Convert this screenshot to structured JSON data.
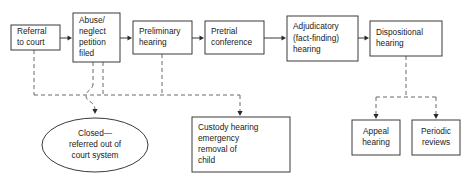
{
  "diagram": {
    "background_color": "#ffffff",
    "box_stroke_color": "#3a3a3a",
    "dashed_stroke_color": "#6b6b6b",
    "text_color": "#1a1a1a",
    "process_nodes": [
      {
        "id": "referral",
        "label_lines": [
          "Referral",
          "to court"
        ],
        "shape": "rect",
        "x": 11,
        "y": 25,
        "w": 49,
        "h": 25
      },
      {
        "id": "petition",
        "label_lines": [
          "Abuse/",
          "neglect",
          "petition",
          "filed"
        ],
        "shape": "rect",
        "x": 73,
        "y": 13,
        "w": 47,
        "h": 49
      },
      {
        "id": "preliminary",
        "label_lines": [
          "Preliminary",
          "hearing"
        ],
        "shape": "rect",
        "x": 133,
        "y": 21,
        "w": 59,
        "h": 33
      },
      {
        "id": "pretrial",
        "label_lines": [
          "Pretrial",
          "conference"
        ],
        "shape": "rect",
        "x": 205,
        "y": 21,
        "w": 59,
        "h": 33
      },
      {
        "id": "adjudicatory",
        "label_lines": [
          "Adjudicatory",
          "(fact-finding)",
          "hearing"
        ],
        "shape": "rect",
        "x": 287,
        "y": 16,
        "w": 71,
        "h": 45
      },
      {
        "id": "dispositional",
        "label_lines": [
          "Dispositional",
          "hearing"
        ],
        "shape": "rect",
        "x": 370,
        "y": 21,
        "w": 72,
        "h": 35
      },
      {
        "id": "closed",
        "label_lines": [
          "Closed—",
          "referred out of",
          "court system"
        ],
        "shape": "ellipse",
        "x": 42,
        "y": 118,
        "w": 106,
        "h": 54
      },
      {
        "id": "custody",
        "label_lines": [
          "Custody hearing",
          "emergency",
          "removal of",
          "child"
        ],
        "shape": "rect",
        "x": 192,
        "y": 117,
        "w": 98,
        "h": 55
      },
      {
        "id": "appeal",
        "label_lines": [
          "Appeal",
          "hearing"
        ],
        "shape": "rect",
        "x": 352,
        "y": 120,
        "w": 48,
        "h": 35
      },
      {
        "id": "periodic",
        "label_lines": [
          "Periodic",
          "reviews"
        ],
        "shape": "rect",
        "x": 412,
        "y": 120,
        "w": 48,
        "h": 35
      }
    ],
    "solid_connectors": [
      {
        "id": "referral-to-petition",
        "from": "referral",
        "to": "petition",
        "path": "M 60 38 L 70 38"
      },
      {
        "id": "petition-to-preliminary",
        "from": "petition",
        "to": "preliminary",
        "path": "M 120 38 L 130 38"
      },
      {
        "id": "preliminary-to-pretrial",
        "from": "preliminary",
        "to": "pretrial",
        "path": "M 192 38 L 202 38"
      },
      {
        "id": "pretrial-to-adjudicatory",
        "from": "pretrial",
        "to": "adjudicatory",
        "path": "M 264 38 L 284 38"
      },
      {
        "id": "adjudicatory-to-dispositional",
        "from": "adjudicatory",
        "to": "dispositional",
        "path": "M 358 38 L 367 38"
      }
    ],
    "solid_arrowheads": [
      {
        "id": "arrow-petition",
        "x": 72,
        "y": 38
      },
      {
        "id": "arrow-preliminary",
        "x": 132,
        "y": 38
      },
      {
        "id": "arrow-pretrial",
        "x": 204,
        "y": 38
      },
      {
        "id": "arrow-adjudicatory",
        "x": 286,
        "y": 38
      },
      {
        "id": "arrow-dispositional",
        "x": 369,
        "y": 38
      }
    ],
    "dashed_connectors": [
      {
        "id": "referral-drop",
        "path": "M 34 50 L 34 95"
      },
      {
        "id": "petition-drop-left",
        "path": "M 93 62 L 93 84"
      },
      {
        "id": "petition-drop-right",
        "path": "M 103 62 L 103 95"
      },
      {
        "id": "trunk-main",
        "path": "M 34 95 L 240 95"
      },
      {
        "id": "petition-jog-to-ellipse",
        "path": "M 93 84 C 93 90, 86 90, 86 96 C 86 102, 95 101, 95 110"
      },
      {
        "id": "preliminary-drop",
        "path": "M 162 54 L 162 95"
      },
      {
        "id": "trunk-to-custody",
        "path": "M 240 95 L 240 112"
      },
      {
        "id": "dispositional-drop",
        "path": "M 406 56 L 406 97"
      },
      {
        "id": "dispositional-branch",
        "path": "M 376 97 L 436 97"
      },
      {
        "id": "branch-to-appeal",
        "path": "M 376 97 L 376 115"
      },
      {
        "id": "branch-to-periodic",
        "path": "M 436 97 L 436 115"
      }
    ],
    "dashed_arrowheads": [
      {
        "id": "arrow-to-closed",
        "x": 95,
        "y": 114
      },
      {
        "id": "arrow-to-custody",
        "x": 240,
        "y": 116
      },
      {
        "id": "arrow-to-appeal",
        "x": 376,
        "y": 119
      },
      {
        "id": "arrow-to-periodic",
        "x": 436,
        "y": 119
      }
    ]
  }
}
